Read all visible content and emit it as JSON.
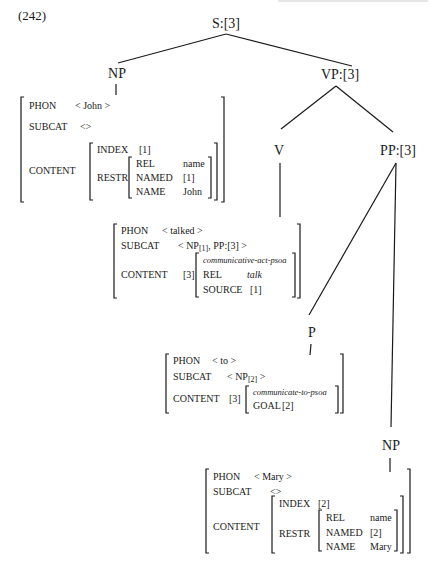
{
  "example_number": "(242)",
  "running_header": "",
  "tree": {
    "root": "S:[3]",
    "subject_np": "NP",
    "vp": "VP:[3]",
    "v": "V",
    "pp": "PP:[3]",
    "p": "P",
    "object_np": "NP"
  },
  "avm_john": {
    "phon_label": "PHON",
    "phon_value": "< John >",
    "subcat_label": "SUBCAT",
    "subcat_value": "<>",
    "content_label": "CONTENT",
    "index_label": "INDEX",
    "index_value": "[1]",
    "restr_label": "RESTR",
    "rel_label": "REL",
    "rel_value": "name",
    "named_label": "NAMED",
    "named_value": "[1]",
    "name_label": "NAME",
    "name_value": "John"
  },
  "avm_talked": {
    "phon_label": "PHON",
    "phon_value": "< talked >",
    "subcat_label": "SUBCAT",
    "subcat_open": "< NP",
    "subcat_sub": "[1]",
    "subcat_rest": ", PP:[3] >",
    "content_label": "CONTENT",
    "content_tag": "[3]",
    "type": "communicative-act-psoa",
    "rel_label": "REL",
    "rel_value": "talk",
    "source_label": "SOURCE",
    "source_value": "[1]"
  },
  "avm_to": {
    "phon_label": "PHON",
    "phon_value": "< to >",
    "subcat_label": "SUBCAT",
    "subcat_open": "< NP",
    "subcat_sub": "[2]",
    "subcat_rest": " >",
    "content_label": "CONTENT",
    "content_tag": "[3]",
    "type": "communicate-to-psoa",
    "goal_label": "GOAL",
    "goal_value": "[2]"
  },
  "avm_mary": {
    "phon_label": "PHON",
    "phon_value": "< Mary >",
    "subcat_label": "SUBCAT",
    "subcat_value": "<>",
    "content_label": "CONTENT",
    "index_label": "INDEX",
    "index_value": "[2]",
    "restr_label": "RESTR",
    "rel_label": "REL",
    "rel_value": "name",
    "named_label": "NAMED",
    "named_value": "[2]",
    "name_label": "NAME",
    "name_value": "Mary"
  }
}
